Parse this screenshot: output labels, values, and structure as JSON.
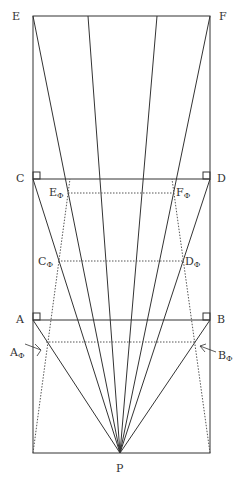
{
  "labels": {
    "E": "E",
    "F": "F",
    "C": "C",
    "D": "D",
    "A": "A",
    "B": "B",
    "P": "P",
    "E_phi": "E",
    "F_phi": "F",
    "C_phi": "C",
    "D_phi": "D",
    "A_phi": "A",
    "B_phi": "B",
    "phi": "Φ"
  },
  "colors": {
    "line": "#333333",
    "dotted": "#555555"
  }
}
